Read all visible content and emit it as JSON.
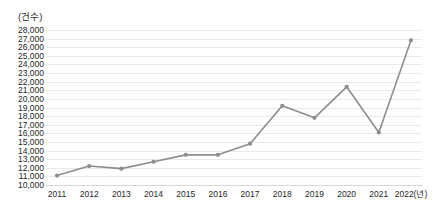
{
  "chart_data": {
    "type": "line",
    "title": "",
    "subtitle": "",
    "unit_label": "(건수)",
    "xlabel": "",
    "ylabel": "",
    "x_axis_suffix": "(년)",
    "categories": [
      "2011",
      "2012",
      "2013",
      "2014",
      "2015",
      "2016",
      "2017",
      "2018",
      "2019",
      "2020",
      "2021",
      "2022"
    ],
    "tick_labels_x": [
      "2011",
      "2012",
      "2013",
      "2014",
      "2015",
      "2016",
      "2017",
      "2018",
      "2019",
      "2020",
      "2021",
      "2022(년)"
    ],
    "values": [
      11100,
      12200,
      11900,
      12700,
      13500,
      13500,
      14800,
      19200,
      17800,
      21400,
      16100,
      26800
    ],
    "ylim": [
      10000,
      28000
    ],
    "y_tick_step": 1000,
    "tick_labels_y": [
      "28,000",
      "27,000",
      "26,000",
      "25,000",
      "24,000",
      "23,000",
      "22,000",
      "21,000",
      "20,000",
      "19,000",
      "18,000",
      "17,000",
      "16,000",
      "15,000",
      "14,000",
      "13,000",
      "12,000",
      "11,000",
      "10,000"
    ],
    "grid": true,
    "grid_axis": "y",
    "legend": false,
    "legend_position": "none",
    "series": [
      {
        "name": "건수",
        "color": "#8d8d8d",
        "marker": "circle",
        "values": [
          11100,
          12200,
          11900,
          12700,
          13500,
          13500,
          14800,
          19200,
          17800,
          21400,
          16100,
          26800
        ]
      }
    ],
    "colors": {
      "line": "#8d8d8d",
      "marker": "#8d8d8d",
      "grid": "#e9e9e9",
      "text": "#262626",
      "background": "#ffffff"
    }
  }
}
